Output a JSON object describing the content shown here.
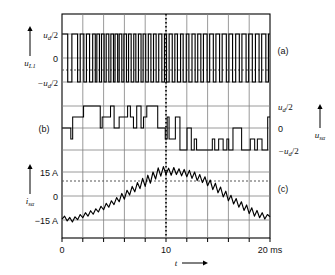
{
  "figure": {
    "title": "",
    "panel_letters": [
      "(a)",
      "(b)",
      "(c)"
    ],
    "xaxis": {
      "label": "t",
      "arrow": "→",
      "unit": "ms",
      "min": 0,
      "max": 20,
      "tick_values": [
        0,
        2,
        4,
        6,
        8,
        10,
        12,
        14,
        16,
        18,
        20
      ],
      "labeled_ticks": [
        {
          "value": 0,
          "text": "0"
        },
        {
          "value": 10,
          "text": "10"
        },
        {
          "value": 20,
          "text": "20 ms"
        }
      ],
      "grid": true
    },
    "marker_line": {
      "value": 10,
      "style": "dotted",
      "note": "vertical dotted marker at t = 10 ms"
    }
  },
  "panels": {
    "a": {
      "letter": "(a)",
      "ylabel_main": "u",
      "ylabel_sub": "L1",
      "ylabel_side": "left",
      "tick_labels": [
        {
          "text_main": "u",
          "text_sub": "d",
          "text_tail": "/2",
          "value": 1
        },
        {
          "text_main": "0",
          "text_sub": "",
          "text_tail": "",
          "value": 0
        },
        {
          "text_main": "−u",
          "text_sub": "d",
          "text_tail": "/2",
          "value": -1
        }
      ],
      "tick_side": "left",
      "reference_line": {
        "value": -0.5,
        "style": "dotted"
      }
    },
    "b": {
      "letter": "(b)",
      "ylabel_main": "u",
      "ylabel_sub": "sα",
      "ylabel_side": "right",
      "tick_labels": [
        {
          "text_main": "u",
          "text_sub": "d",
          "text_tail": "/2",
          "value": 1
        },
        {
          "text_main": "0",
          "text_sub": "",
          "text_tail": "",
          "value": 0
        },
        {
          "text_main": "−u",
          "text_sub": "d",
          "text_tail": "/2",
          "value": -1
        }
      ],
      "tick_side": "right",
      "letter_side": "left"
    },
    "c": {
      "letter": "(c)",
      "ylabel_main": "i",
      "ylabel_sub": "sα",
      "ylabel_side": "left",
      "tick_labels": [
        {
          "text": "15 A",
          "value": 15
        },
        {
          "text": "0",
          "value": 0
        },
        {
          "text": "−15 A",
          "value": -15
        }
      ],
      "tick_side": "left",
      "letter_side": "right",
      "reference_line": {
        "value": 5,
        "style": "dotted"
      }
    }
  },
  "chart_data": {
    "type": "line",
    "title": "",
    "xlabel": "t",
    "xunit": "ms",
    "xlim": [
      0,
      20
    ],
    "grid": true,
    "legend": "none",
    "subplots": [
      {
        "name": "a",
        "label": "(a)",
        "ylabel": "u_L1",
        "ylim": [
          -1.3,
          1.3
        ],
        "yticks": [
          -1,
          0,
          1
        ],
        "ytick_labels": [
          "-u_d/2",
          "0",
          "u_d/2"
        ],
        "waveform_type": "two-level PWM square wave",
        "levels": [
          -1,
          1
        ],
        "reference_dotted_y": -0.5,
        "transitions_ms": [
          0.0,
          0.55,
          0.95,
          1.5,
          1.75,
          2.1,
          2.35,
          2.65,
          2.95,
          3.2,
          3.35,
          3.6,
          3.8,
          4.05,
          4.25,
          4.5,
          4.7,
          4.95,
          5.1,
          5.35,
          5.5,
          5.75,
          5.95,
          6.2,
          6.4,
          6.65,
          6.9,
          7.1,
          7.35,
          7.6,
          7.8,
          8.05,
          8.3,
          8.55,
          8.8,
          9.05,
          9.3,
          9.6,
          9.85,
          10.05,
          10.3,
          10.6,
          10.85,
          11.1,
          11.4,
          11.65,
          11.95,
          12.2,
          12.5,
          12.8,
          13.05,
          13.35,
          13.6,
          13.95,
          14.2,
          14.55,
          14.8,
          15.15,
          15.4,
          15.8,
          16.05,
          16.4,
          16.7,
          17.05,
          17.3,
          17.7,
          17.95,
          18.3,
          18.6,
          18.95,
          19.2,
          19.6,
          19.85
        ],
        "start_level": 1
      },
      {
        "name": "b",
        "label": "(b)",
        "ylabel": "u_s_alpha",
        "ylim": [
          -1.3,
          1.3
        ],
        "yticks": [
          -1,
          0,
          1
        ],
        "ytick_labels": [
          "-u_d/2",
          "0",
          "u_d/2"
        ],
        "waveform_type": "multilevel PWM",
        "levels": [
          -1,
          -0.5,
          0,
          0.5,
          1
        ]
      },
      {
        "name": "c",
        "label": "(c)",
        "ylabel": "i_s_alpha",
        "yunit": "A",
        "ylim": [
          -22,
          22
        ],
        "yticks": [
          -15,
          0,
          15
        ],
        "ytick_labels": [
          "-15 A",
          "0",
          "15 A"
        ],
        "waveform_type": "sinusoidal current with switching ripple",
        "reference_dotted_y": 5,
        "approx_fundamental": {
          "amplitude_A": 17,
          "period_ms": 20,
          "phase": "rises from -15 A at t=0, peaks ~+18 A near t=6.5 ms, falls to ~-15 A by t=20 ms"
        },
        "samples": [
          {
            "t": 0.0,
            "i": -14.5
          },
          {
            "t": 0.25,
            "i": -12.6
          },
          {
            "t": 0.5,
            "i": -15.6
          },
          {
            "t": 0.75,
            "i": -13.4
          },
          {
            "t": 1.0,
            "i": -16.2
          },
          {
            "t": 1.25,
            "i": -13.0
          },
          {
            "t": 1.5,
            "i": -14.8
          },
          {
            "t": 1.75,
            "i": -11.6
          },
          {
            "t": 2.0,
            "i": -13.6
          },
          {
            "t": 2.25,
            "i": -10.4
          },
          {
            "t": 2.5,
            "i": -12.6
          },
          {
            "t": 2.75,
            "i": -9.2
          },
          {
            "t": 3.0,
            "i": -11.4
          },
          {
            "t": 3.25,
            "i": -8.0
          },
          {
            "t": 3.5,
            "i": -10.0
          },
          {
            "t": 3.75,
            "i": -6.4
          },
          {
            "t": 4.0,
            "i": -8.6
          },
          {
            "t": 4.25,
            "i": -4.6
          },
          {
            "t": 4.5,
            "i": -7.0
          },
          {
            "t": 4.75,
            "i": -3.0
          },
          {
            "t": 5.0,
            "i": -5.4
          },
          {
            "t": 5.25,
            "i": -1.0
          },
          {
            "t": 5.5,
            "i": -3.6
          },
          {
            "t": 5.75,
            "i": 1.6
          },
          {
            "t": 6.0,
            "i": -2.0
          },
          {
            "t": 6.25,
            "i": 3.6
          },
          {
            "t": 6.5,
            "i": 0.6
          },
          {
            "t": 6.75,
            "i": 6.0
          },
          {
            "t": 7.0,
            "i": 2.6
          },
          {
            "t": 7.25,
            "i": 8.4
          },
          {
            "t": 7.5,
            "i": 4.6
          },
          {
            "t": 7.75,
            "i": 11.0
          },
          {
            "t": 8.0,
            "i": 6.0
          },
          {
            "t": 8.25,
            "i": 13.0
          },
          {
            "t": 8.5,
            "i": 8.0
          },
          {
            "t": 8.75,
            "i": 15.0
          },
          {
            "t": 9.0,
            "i": 10.6
          },
          {
            "t": 9.25,
            "i": 17.6
          },
          {
            "t": 9.5,
            "i": 12.4
          },
          {
            "t": 9.75,
            "i": 18.4
          },
          {
            "t": 10.0,
            "i": 13.6
          },
          {
            "t": 10.25,
            "i": 17.4
          },
          {
            "t": 10.5,
            "i": 13.0
          },
          {
            "t": 10.75,
            "i": 17.8
          },
          {
            "t": 11.0,
            "i": 13.4
          },
          {
            "t": 11.25,
            "i": 17.0
          },
          {
            "t": 11.5,
            "i": 12.6
          },
          {
            "t": 11.75,
            "i": 16.6
          },
          {
            "t": 12.0,
            "i": 12.0
          },
          {
            "t": 12.25,
            "i": 16.0
          },
          {
            "t": 12.5,
            "i": 11.0
          },
          {
            "t": 12.75,
            "i": 15.0
          },
          {
            "t": 13.0,
            "i": 9.6
          },
          {
            "t": 13.25,
            "i": 13.4
          },
          {
            "t": 13.5,
            "i": 8.4
          },
          {
            "t": 13.75,
            "i": 12.0
          },
          {
            "t": 14.0,
            "i": 6.4
          },
          {
            "t": 14.25,
            "i": 10.0
          },
          {
            "t": 14.5,
            "i": 4.0
          },
          {
            "t": 14.75,
            "i": 8.0
          },
          {
            "t": 15.0,
            "i": 2.0
          },
          {
            "t": 15.25,
            "i": 5.6
          },
          {
            "t": 15.5,
            "i": -0.6
          },
          {
            "t": 15.75,
            "i": 3.0
          },
          {
            "t": 16.0,
            "i": -3.0
          },
          {
            "t": 16.25,
            "i": 0.4
          },
          {
            "t": 16.5,
            "i": -5.0
          },
          {
            "t": 16.75,
            "i": -1.6
          },
          {
            "t": 17.0,
            "i": -7.0
          },
          {
            "t": 17.25,
            "i": -3.6
          },
          {
            "t": 17.5,
            "i": -9.0
          },
          {
            "t": 17.75,
            "i": -5.6
          },
          {
            "t": 18.0,
            "i": -11.0
          },
          {
            "t": 18.25,
            "i": -7.4
          },
          {
            "t": 18.5,
            "i": -12.6
          },
          {
            "t": 18.75,
            "i": -9.0
          },
          {
            "t": 19.0,
            "i": -13.6
          },
          {
            "t": 19.25,
            "i": -10.4
          },
          {
            "t": 19.5,
            "i": -14.4
          },
          {
            "t": 19.75,
            "i": -11.6
          },
          {
            "t": 20.0,
            "i": -13.0
          }
        ]
      }
    ]
  },
  "colors": {
    "trace": "#000000",
    "grid": "#808080",
    "frame": "#000000",
    "background": "#ffffff",
    "dotted_reference": "#555555"
  }
}
